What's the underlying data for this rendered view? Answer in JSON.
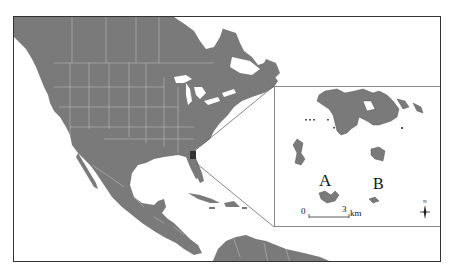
{
  "figure": {
    "type": "location map",
    "main_map": {
      "region": "North America, Central America, Caribbean",
      "land_color": "#7a7a7a",
      "border_color": "#b8b8b8",
      "water_color": "#ffffff"
    },
    "inset": {
      "site_labels": [
        "A",
        "B"
      ],
      "scale_bar": {
        "start": "0",
        "end": "3",
        "unit": "km"
      },
      "north_arrow": "N"
    }
  }
}
